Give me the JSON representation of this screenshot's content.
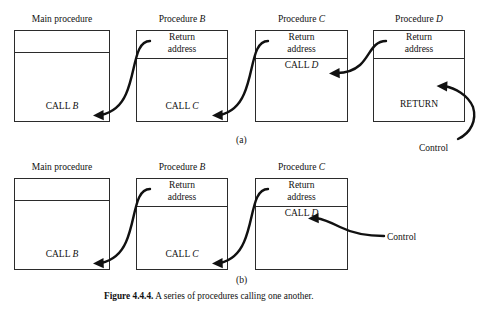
{
  "figure": {
    "caption_bold": "Figure 4.4.4.",
    "caption_rest": " A series of procedures calling one another.",
    "part_a_label": "(a)",
    "part_b_label": "(b)"
  },
  "text": {
    "main_procedure": "Main procedure",
    "procedure_word": "Procedure",
    "return_address": "Return address",
    "return_word": "Return",
    "address_word": "address",
    "control": "Control",
    "call_word": "CALL",
    "return_stmt": "RETURN",
    "name_b": "B",
    "name_c": "C",
    "name_d": "D"
  },
  "part_a": {
    "boxes": [
      {
        "id": "main",
        "title_plain": "Main procedure",
        "title_italic": "",
        "top_cell": "",
        "body_cell_plain": "CALL ",
        "body_cell_italic": "B",
        "has_return_address": false
      },
      {
        "id": "b",
        "title_plain": "Procedure ",
        "title_italic": "B",
        "top_cell": "Return address",
        "body_cell_plain": "CALL ",
        "body_cell_italic": "C",
        "has_return_address": true
      },
      {
        "id": "c",
        "title_plain": "Procedure ",
        "title_italic": "C",
        "top_cell": "Return address",
        "body_cell_plain": "CALL ",
        "body_cell_italic": "D",
        "has_return_address": true
      },
      {
        "id": "d",
        "title_plain": "Procedure ",
        "title_italic": "D",
        "top_cell": "Return address",
        "body_cell_plain": "RETURN",
        "body_cell_italic": "",
        "has_return_address": true
      }
    ],
    "control_label": "Control"
  },
  "part_b": {
    "boxes": [
      {
        "id": "main",
        "title_plain": "Main procedure",
        "title_italic": "",
        "top_cell": "",
        "body_cell_plain": "CALL ",
        "body_cell_italic": "B",
        "has_return_address": false
      },
      {
        "id": "b",
        "title_plain": "Procedure ",
        "title_italic": "B",
        "top_cell": "Return address",
        "body_cell_plain": "CALL ",
        "body_cell_italic": "C",
        "has_return_address": true
      },
      {
        "id": "c",
        "title_plain": "Procedure ",
        "title_italic": "C",
        "top_cell": "Return address",
        "body_cell_plain": "CALL ",
        "body_cell_italic": "D",
        "has_return_address": true
      }
    ],
    "control_label": "Control"
  },
  "colors": {
    "ink": "#111111",
    "rule": "#2b2b2b",
    "paper": "#ffffff"
  }
}
